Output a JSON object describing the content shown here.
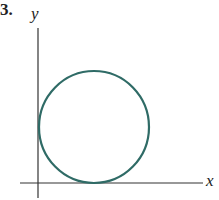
{
  "problem_number": "3.",
  "axes": {
    "x_label": "x",
    "y_label": "y"
  },
  "figure": {
    "circle_color": "#2f6b66",
    "axis_color": "#333333"
  }
}
